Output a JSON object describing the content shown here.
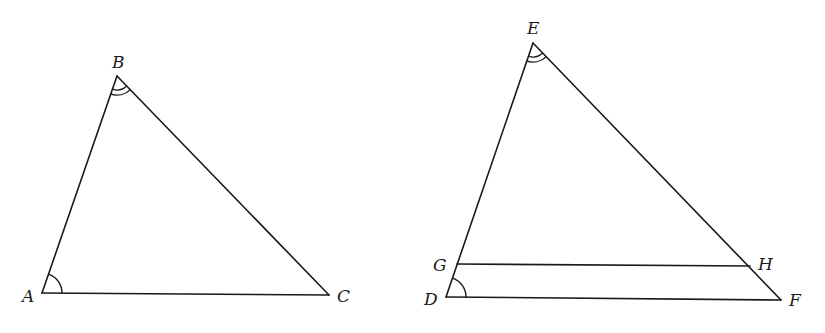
{
  "diagram": {
    "type": "geometry",
    "triangle1": {
      "vertices": {
        "A": {
          "label": "A",
          "x": 42,
          "y": 293
        },
        "B": {
          "label": "B",
          "x": 117,
          "y": 76
        },
        "C": {
          "label": "C",
          "x": 329,
          "y": 295
        }
      },
      "angle_marks": [
        {
          "vertex": "A",
          "arcs": 1
        },
        {
          "vertex": "B",
          "arcs": 2
        }
      ]
    },
    "triangle2": {
      "vertices": {
        "E": {
          "label": "E",
          "x": 533,
          "y": 43
        },
        "D": {
          "label": "D",
          "x": 446,
          "y": 297
        },
        "F": {
          "label": "F",
          "x": 781,
          "y": 300
        }
      },
      "points": {
        "G": {
          "label": "G",
          "x": 457,
          "y": 264
        },
        "H": {
          "label": "H",
          "x": 750,
          "y": 266
        }
      },
      "segments": [
        "GH"
      ],
      "angle_marks": [
        {
          "vertex": "E",
          "arcs": 2
        },
        {
          "vertex": "D",
          "arcs": 1
        }
      ]
    },
    "labels": {
      "A": "A",
      "B": "B",
      "C": "C",
      "D": "D",
      "E": "E",
      "F": "F",
      "G": "G",
      "H": "H"
    }
  }
}
